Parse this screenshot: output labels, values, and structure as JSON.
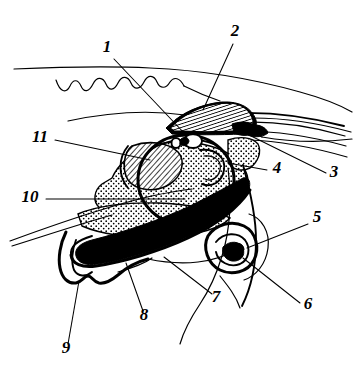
{
  "figure": {
    "kind": "anatomical-line-drawing",
    "title": "",
    "caption": "",
    "background_color": "#ffffff",
    "ink_color": "#000000",
    "width": 359,
    "height": 377,
    "label_style": "italic-serif-bold"
  },
  "labels": [
    {
      "id": "1",
      "text": "1",
      "x": 107,
      "y": 52,
      "anchor": "middle"
    },
    {
      "id": "2",
      "text": "2",
      "x": 235,
      "y": 36,
      "anchor": "middle"
    },
    {
      "id": "3",
      "text": "3",
      "x": 334,
      "y": 177,
      "anchor": "middle"
    },
    {
      "id": "4",
      "text": "4",
      "x": 277,
      "y": 173,
      "anchor": "middle"
    },
    {
      "id": "5",
      "text": "5",
      "x": 317,
      "y": 222,
      "anchor": "middle"
    },
    {
      "id": "6",
      "text": "6",
      "x": 308,
      "y": 309,
      "anchor": "middle"
    },
    {
      "id": "7",
      "text": "7",
      "x": 216,
      "y": 302,
      "anchor": "middle"
    },
    {
      "id": "8",
      "text": "8",
      "x": 144,
      "y": 320,
      "anchor": "middle"
    },
    {
      "id": "9",
      "text": "9",
      "x": 66,
      "y": 353,
      "anchor": "middle"
    },
    {
      "id": "10",
      "text": "10",
      "x": 30,
      "y": 202,
      "anchor": "middle"
    },
    {
      "id": "11",
      "text": "11",
      "x": 40,
      "y": 142,
      "anchor": "middle"
    }
  ],
  "leaders": [
    {
      "for": "1",
      "d": "M 114 59 L 186 135"
    },
    {
      "for": "2",
      "d": "M 233 44 L 203 110"
    },
    {
      "for": "3",
      "d": "M 326 173 L 245 133"
    },
    {
      "for": "4",
      "d": "M 267 170 L 228 163"
    },
    {
      "for": "5",
      "d": "M 308 224 L 247 248"
    },
    {
      "for": "6",
      "d": "M 300 303 L 243 258"
    },
    {
      "for": "7",
      "d": "M 212 294 L 164 257"
    },
    {
      "for": "8",
      "d": "M 143 311 L 126 263"
    },
    {
      "for": "9",
      "d": "M 68 344 L 79 281"
    },
    {
      "for": "10",
      "d": "M 46 199 L 185 199"
    },
    {
      "for": "11",
      "d": "M 55 140 L 150 160"
    }
  ],
  "regions": [
    {
      "name": "scalp-wavy-outline",
      "tone": "outline"
    },
    {
      "name": "skull-upper-contour",
      "tone": "outline"
    },
    {
      "name": "hatched-cochlea-coil",
      "tone": "hatched"
    },
    {
      "name": "stippled-bone-mass",
      "tone": "stippled"
    },
    {
      "name": "solid-black-canal",
      "tone": "solid"
    },
    {
      "name": "spiral-organ",
      "tone": "solid"
    },
    {
      "name": "ossicle-white-body",
      "tone": "white"
    }
  ]
}
